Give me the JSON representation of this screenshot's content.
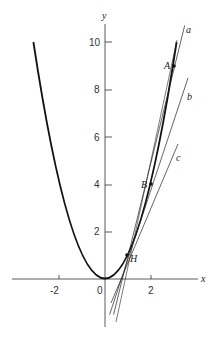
{
  "figure": {
    "function": "y = x^2",
    "axes": {
      "x_label": "x",
      "y_label": "y",
      "x_ticks": [
        "-2",
        "0",
        "2"
      ],
      "y_ticks": [
        "2",
        "4",
        "6",
        "8",
        "10"
      ]
    },
    "points": [
      {
        "label": "A",
        "x": 3,
        "y": 9
      },
      {
        "label": "B",
        "x": 2,
        "y": 4
      },
      {
        "label": "H",
        "x": 1,
        "y": 1
      }
    ],
    "lines": [
      {
        "label": "a",
        "description": "secant through H and A",
        "slope": 4
      },
      {
        "label": "b",
        "description": "secant through H and B",
        "slope": 3
      },
      {
        "label": "c",
        "description": "tangent at H",
        "slope": 2
      }
    ]
  }
}
